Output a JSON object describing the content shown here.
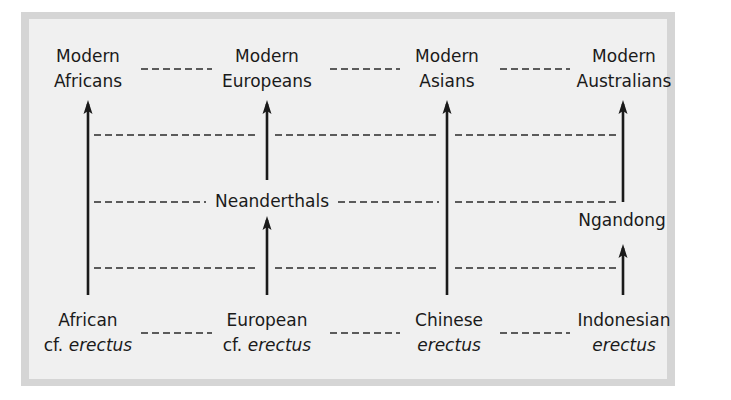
{
  "diagram": {
    "type": "multiregional-evolution",
    "colors": {
      "panel_border": "#d5d5d5",
      "panel_fill": "#f0f0f0",
      "ink": "#1a1a1a"
    },
    "top_row": [
      {
        "line1": "Modern",
        "line2": "Africans"
      },
      {
        "line1": "Modern",
        "line2": "Europeans"
      },
      {
        "line1": "Modern",
        "line2": "Asians"
      },
      {
        "line1": "Modern",
        "line2": "Australians"
      }
    ],
    "bottom_row": [
      {
        "line1": "African",
        "prefix": "cf. ",
        "italic": "erectus"
      },
      {
        "line1": "European",
        "prefix": "cf. ",
        "italic": "erectus"
      },
      {
        "line1": "Chinese",
        "prefix": "",
        "italic": "erectus"
      },
      {
        "line1": "Indonesian",
        "prefix": "",
        "italic": "erectus"
      }
    ],
    "intermediate": {
      "europe": "Neanderthals",
      "australia": "Ngandong"
    },
    "edges": [
      {
        "from": "African cf. erectus",
        "to": "Modern Africans",
        "type": "arrow"
      },
      {
        "from": "European cf. erectus",
        "to": "Neanderthals",
        "type": "arrow"
      },
      {
        "from": "Neanderthals",
        "to": "Modern Europeans",
        "type": "arrow"
      },
      {
        "from": "Chinese erectus",
        "to": "Modern Asians",
        "type": "arrow"
      },
      {
        "from": "Indonesian erectus",
        "to": "Ngandong",
        "type": "arrow"
      },
      {
        "from": "Ngandong",
        "to": "Modern Australians",
        "type": "arrow"
      }
    ],
    "gene_flow_links": "dashed horizontal lines connecting adjacent lineages at top, bottom, and three intermediate levels"
  }
}
